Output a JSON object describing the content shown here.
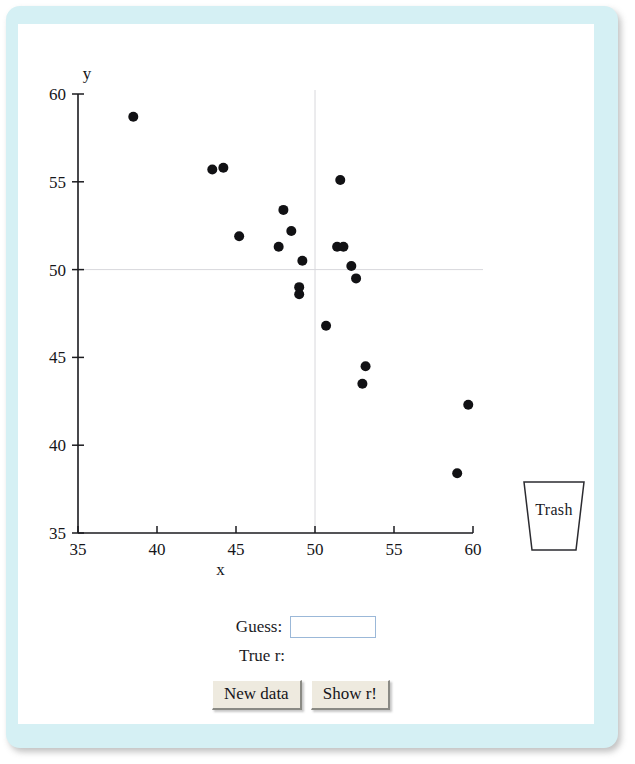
{
  "frame": {
    "background_color": "#d5f0f4",
    "canvas_color": "#ffffff"
  },
  "plot": {
    "xlabel": "x",
    "ylabel": "y",
    "x_ticks": [
      "35",
      "40",
      "45",
      "50",
      "55",
      "60"
    ],
    "y_ticks": [
      "35",
      "40",
      "45",
      "50",
      "55",
      "60"
    ]
  },
  "trash": {
    "label": "Trash"
  },
  "controls": {
    "guess_label": "Guess:",
    "guess_value": "",
    "guess_placeholder": "",
    "true_r_label": "True r:",
    "true_r_value": "",
    "new_data_label": "New data",
    "show_r_label": "Show r!"
  },
  "chart_data": {
    "type": "scatter",
    "title": "",
    "xlabel": "x",
    "ylabel": "y",
    "xlim": [
      35,
      60
    ],
    "ylim": [
      35,
      60
    ],
    "xticks": [
      35,
      40,
      45,
      50,
      55,
      60
    ],
    "yticks": [
      35,
      40,
      45,
      50,
      55,
      60
    ],
    "grid": true,
    "gridlines": {
      "x": [
        50
      ],
      "y": [
        50
      ]
    },
    "legend": null,
    "marker_color": "#111114",
    "marker_size": 5,
    "points": [
      [
        38.5,
        58.7
      ],
      [
        43.5,
        55.7
      ],
      [
        44.2,
        55.8
      ],
      [
        45.2,
        51.9
      ],
      [
        48.0,
        53.4
      ],
      [
        47.7,
        51.3
      ],
      [
        48.5,
        52.2
      ],
      [
        49.2,
        50.5
      ],
      [
        49.0,
        49.0
      ],
      [
        49.0,
        48.6
      ],
      [
        51.6,
        55.1
      ],
      [
        51.4,
        51.3
      ],
      [
        51.8,
        51.3
      ],
      [
        52.3,
        50.2
      ],
      [
        52.6,
        49.5
      ],
      [
        50.7,
        46.8
      ],
      [
        53.2,
        44.5
      ],
      [
        53.0,
        43.5
      ],
      [
        59.7,
        42.3
      ],
      [
        59.0,
        38.4
      ]
    ]
  }
}
